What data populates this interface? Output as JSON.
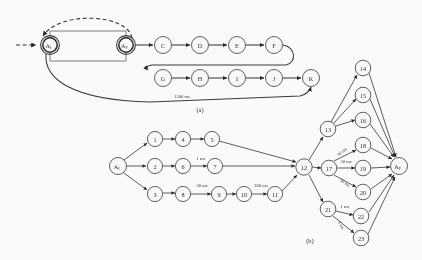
{
  "figure": {
    "captions": [
      {
        "id": "a",
        "text": "(a)",
        "x": 200,
        "y": 112
      },
      {
        "id": "b",
        "text": "(b)",
        "x": 310,
        "y": 243
      }
    ]
  },
  "panel_a": {
    "name": "panel-a",
    "nodes": [
      {
        "id": "AI",
        "label": "A",
        "sub": "I",
        "x": 50,
        "y": 45,
        "r": 9,
        "style": "double"
      },
      {
        "id": "AF",
        "label": "A",
        "sub": "F",
        "x": 126,
        "y": 45,
        "r": 9,
        "style": "double"
      },
      {
        "id": "C",
        "label": "C",
        "sub": "",
        "x": 163,
        "y": 45,
        "r": 8.5,
        "style": "single"
      },
      {
        "id": "D",
        "label": "D",
        "sub": "",
        "x": 200,
        "y": 45,
        "r": 8.5,
        "style": "single"
      },
      {
        "id": "E",
        "label": "E",
        "sub": "",
        "x": 237,
        "y": 45,
        "r": 8.5,
        "style": "single"
      },
      {
        "id": "F",
        "label": "F",
        "sub": "",
        "x": 274,
        "y": 45,
        "r": 8.5,
        "style": "single"
      },
      {
        "id": "G",
        "label": "G",
        "sub": "",
        "x": 163,
        "y": 78,
        "r": 8.5,
        "style": "single"
      },
      {
        "id": "H",
        "label": "H",
        "sub": "",
        "x": 200,
        "y": 78,
        "r": 8.5,
        "style": "single"
      },
      {
        "id": "I",
        "label": "I",
        "sub": "",
        "x": 237,
        "y": 78,
        "r": 8.5,
        "style": "single"
      },
      {
        "id": "J",
        "label": "J",
        "sub": "",
        "x": 274,
        "y": 78,
        "r": 8.5,
        "style": "single"
      },
      {
        "id": "K",
        "label": "K",
        "sub": "",
        "x": 311,
        "y": 78,
        "r": 8.5,
        "style": "single"
      }
    ],
    "edge_labels": [
      {
        "id": "latency-1500ms",
        "text": "1500 ms",
        "x": 182,
        "y": 98
      }
    ],
    "entry_arrow": {
      "name": "entry-arrow-dashed"
    },
    "feedback_arrow": {
      "name": "feedback-arrow-dashed"
    }
  },
  "panel_b": {
    "name": "panel-b",
    "nodes": [
      {
        "id": "AI",
        "label": "A",
        "sub": "I",
        "x": 118,
        "y": 166,
        "r": 8.5,
        "style": "single"
      },
      {
        "id": "1",
        "label": "1",
        "sub": "",
        "x": 155,
        "y": 139,
        "r": 7.6,
        "style": "single"
      },
      {
        "id": "2",
        "label": "2",
        "sub": "",
        "x": 155,
        "y": 166,
        "r": 7.6,
        "style": "single"
      },
      {
        "id": "3",
        "label": "3",
        "sub": "",
        "x": 155,
        "y": 194,
        "r": 7.6,
        "style": "single"
      },
      {
        "id": "4",
        "label": "4",
        "sub": "",
        "x": 183,
        "y": 139,
        "r": 7.6,
        "style": "single"
      },
      {
        "id": "5",
        "label": "5",
        "sub": "",
        "x": 212,
        "y": 139,
        "r": 7.6,
        "style": "single"
      },
      {
        "id": "6",
        "label": "6",
        "sub": "",
        "x": 183,
        "y": 166,
        "r": 7.6,
        "style": "single"
      },
      {
        "id": "7",
        "label": "7",
        "sub": "",
        "x": 215,
        "y": 166,
        "r": 7.6,
        "style": "single"
      },
      {
        "id": "8",
        "label": "8",
        "sub": "",
        "x": 183,
        "y": 194,
        "r": 7.6,
        "style": "single"
      },
      {
        "id": "9",
        "label": "9",
        "sub": "",
        "x": 219,
        "y": 194,
        "r": 7.6,
        "style": "single"
      },
      {
        "id": "10",
        "label": "10",
        "sub": "",
        "x": 244,
        "y": 194,
        "r": 7.6,
        "style": "single"
      },
      {
        "id": "11",
        "label": "11",
        "sub": "",
        "x": 275,
        "y": 194,
        "r": 7.6,
        "style": "single"
      },
      {
        "id": "12",
        "label": "12",
        "sub": "",
        "x": 304,
        "y": 167,
        "r": 8.2,
        "style": "single"
      },
      {
        "id": "13",
        "label": "13",
        "sub": "",
        "x": 328,
        "y": 129,
        "r": 7.8,
        "style": "single"
      },
      {
        "id": "14",
        "label": "14",
        "sub": "",
        "x": 363,
        "y": 68,
        "r": 7.8,
        "style": "single"
      },
      {
        "id": "15",
        "label": "15",
        "sub": "",
        "x": 363,
        "y": 95,
        "r": 7.8,
        "style": "single"
      },
      {
        "id": "16",
        "label": "16",
        "sub": "",
        "x": 363,
        "y": 120,
        "r": 7.8,
        "style": "single"
      },
      {
        "id": "17",
        "label": "17",
        "sub": "",
        "x": 329,
        "y": 168,
        "r": 7.8,
        "style": "single"
      },
      {
        "id": "18",
        "label": "18",
        "sub": "",
        "x": 363,
        "y": 145,
        "r": 7.8,
        "style": "single"
      },
      {
        "id": "19",
        "label": "19",
        "sub": "",
        "x": 363,
        "y": 168,
        "r": 7.8,
        "style": "single"
      },
      {
        "id": "20",
        "label": "20",
        "sub": "",
        "x": 363,
        "y": 192,
        "r": 7.8,
        "style": "single"
      },
      {
        "id": "21",
        "label": "21",
        "sub": "",
        "x": 328,
        "y": 209,
        "r": 7.8,
        "style": "single"
      },
      {
        "id": "22",
        "label": "22",
        "sub": "",
        "x": 361,
        "y": 216,
        "r": 7.8,
        "style": "single"
      },
      {
        "id": "23",
        "label": "23",
        "sub": "",
        "x": 361,
        "y": 238,
        "r": 7.8,
        "style": "single"
      },
      {
        "id": "AF",
        "label": "A",
        "sub": "F",
        "x": 399,
        "y": 166,
        "r": 8.5,
        "style": "single"
      }
    ],
    "edge_labels": [
      {
        "id": "e-6-7",
        "text": "1 ms",
        "x": 201,
        "y": 160,
        "rot": 0
      },
      {
        "id": "e-8-9",
        "text": "50 ms",
        "x": 202,
        "y": 187,
        "rot": 0
      },
      {
        "id": "e-10-11",
        "text": "200 ms",
        "x": 261,
        "y": 187,
        "rot": 0
      },
      {
        "id": "e-17-18",
        "text": "50 ms",
        "x": 343,
        "y": 153,
        "rot": -40
      },
      {
        "id": "e-17-19",
        "text": "50 ms",
        "x": 346,
        "y": 163,
        "rot": 0
      },
      {
        "id": "e-17-20",
        "text": "50 ms",
        "x": 344,
        "y": 184,
        "rot": 36
      },
      {
        "id": "e-21-22",
        "text": "1 ms",
        "x": 345,
        "y": 208,
        "rot": 0
      },
      {
        "id": "e-21-23",
        "text": "1 ms",
        "x": 340,
        "y": 226,
        "rot": 60
      }
    ]
  }
}
